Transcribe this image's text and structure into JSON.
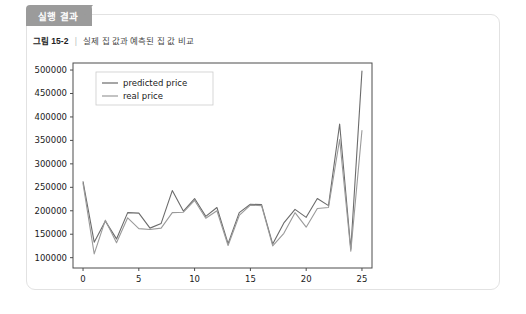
{
  "tag": {
    "label": "실행 결과"
  },
  "caption": {
    "figure_number": "그림 15-2",
    "separator": "|",
    "text": "실제 집 값과 예측된 집 값 비교"
  },
  "colors": {
    "tag_background": "#9b9b9b",
    "panel_border": "#e2e2e2",
    "predicted_line": "#6b6b6b",
    "real_line": "#9a9a9a",
    "axis": "#4d4d4d"
  },
  "chart_data": {
    "type": "line",
    "title": "",
    "xlabel": "",
    "ylabel": "",
    "xlim": [
      -0.9,
      25.9
    ],
    "ylim": [
      78000,
      515000
    ],
    "xticks": [
      0,
      5,
      10,
      15,
      20,
      25
    ],
    "yticks": [
      100000,
      150000,
      200000,
      250000,
      300000,
      350000,
      400000,
      450000,
      500000
    ],
    "grid": false,
    "legend_position": "upper left",
    "x": [
      0,
      1,
      2,
      3,
      4,
      5,
      6,
      7,
      8,
      9,
      10,
      11,
      12,
      13,
      14,
      15,
      16,
      17,
      18,
      19,
      20,
      21,
      22,
      23,
      24,
      25
    ],
    "series": [
      {
        "name": "predicted price",
        "color": "#6b6b6b",
        "values": [
          262000,
          133000,
          178000,
          140000,
          196000,
          195000,
          163000,
          173000,
          243000,
          199000,
          226000,
          188000,
          207000,
          130000,
          196000,
          214000,
          213000,
          129000,
          174000,
          203000,
          186000,
          226000,
          211000,
          385000,
          118000,
          498000
        ]
      },
      {
        "name": "real price",
        "color": "#9a9a9a",
        "values": [
          258000,
          108000,
          180000,
          132000,
          185000,
          162000,
          160000,
          163000,
          196000,
          197000,
          222000,
          184000,
          200000,
          126000,
          190000,
          212000,
          211000,
          125000,
          152000,
          196000,
          165000,
          205000,
          207000,
          352000,
          114000,
          371000
        ]
      }
    ]
  }
}
